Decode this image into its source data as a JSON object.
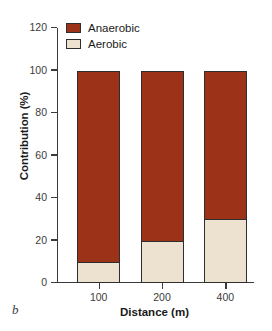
{
  "panel_letter": "b",
  "legend": {
    "position": "top-left-inside",
    "items": [
      {
        "label": "Anaerobic",
        "color": "#9c3318",
        "key": "anaerobic"
      },
      {
        "label": "Aerobic",
        "color": "#ede2d0",
        "key": "aerobic"
      }
    ]
  },
  "chart_data": {
    "type": "bar",
    "subtype": "stacked",
    "title": "",
    "xlabel": "Distance (m)",
    "ylabel": "Contribution (%)",
    "categories": [
      "100",
      "200",
      "400"
    ],
    "series": [
      {
        "name": "Aerobic",
        "values": [
          10,
          20,
          30
        ],
        "color": "#ede2d0"
      },
      {
        "name": "Anaerobic",
        "values": [
          90,
          80,
          70
        ],
        "color": "#9c3318"
      }
    ],
    "ylim": [
      0,
      120
    ],
    "yticks": [
      0,
      20,
      40,
      60,
      80,
      100,
      120
    ],
    "ytick_labels": [
      "0",
      "20",
      "40",
      "60",
      "80",
      "100",
      "120"
    ],
    "xtick_labels": [
      "100",
      "200",
      "400"
    ],
    "grid": false,
    "stack_order": [
      "Aerobic",
      "Anaerobic"
    ],
    "bar_totals": [
      100,
      100,
      100
    ]
  }
}
